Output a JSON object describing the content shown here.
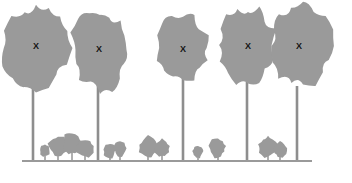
{
  "figure": {
    "clipped_top_text": "",
    "canvas": {
      "width": 352,
      "height": 183
    },
    "colors": {
      "background": "#ffffff",
      "foliage": "#9a9a9a",
      "trunk": "#8e8e8e",
      "ground": "#9a9a9a",
      "label": "#141414"
    },
    "ground": {
      "name": "ground-line",
      "y": 161,
      "x_start": 22,
      "x_end": 312,
      "thickness": 2.2
    },
    "canopy_trees": [
      {
        "id": "tree-1",
        "label": "X",
        "label_x": 36,
        "label_y": 47,
        "trunk_x": 33,
        "trunk_top": 72,
        "trunk_bottom": 161,
        "trunk_width": 2.6,
        "crown_cx": 36,
        "crown_cy": 48,
        "crown_rx": 33,
        "crown_ry": 43,
        "seed": 11
      },
      {
        "id": "tree-2",
        "label": "X",
        "label_x": 99,
        "label_y": 50,
        "trunk_x": 98,
        "trunk_top": 84,
        "trunk_bottom": 161,
        "trunk_width": 2.6,
        "crown_cx": 100,
        "crown_cy": 50,
        "crown_rx": 28,
        "crown_ry": 40,
        "seed": 23
      },
      {
        "id": "tree-3",
        "label": "X",
        "label_x": 183,
        "label_y": 50,
        "trunk_x": 183,
        "trunk_top": 70,
        "trunk_bottom": 161,
        "trunk_width": 2.6,
        "crown_cx": 183,
        "crown_cy": 48,
        "crown_rx": 26,
        "crown_ry": 31,
        "seed": 37
      },
      {
        "id": "tree-4",
        "label": "X",
        "label_x": 248,
        "label_y": 47,
        "trunk_x": 247,
        "trunk_top": 80,
        "trunk_bottom": 161,
        "trunk_width": 2.6,
        "crown_cx": 248,
        "crown_cy": 45,
        "crown_rx": 27,
        "crown_ry": 38,
        "seed": 53
      },
      {
        "id": "tree-5",
        "label": "X",
        "label_x": 299,
        "label_y": 47,
        "trunk_x": 297,
        "trunk_top": 86,
        "trunk_bottom": 161,
        "trunk_width": 2.6,
        "crown_cx": 303,
        "crown_cy": 46,
        "crown_rx": 31,
        "crown_ry": 41,
        "seed": 71
      }
    ],
    "understory_shrubs": [
      {
        "id": "shrub-1",
        "cx": 45,
        "cy": 152,
        "rx": 5,
        "ry": 6,
        "trunk_bottom": 161,
        "seed": 5
      },
      {
        "id": "shrub-2",
        "cx": 58,
        "cy": 147,
        "rx": 9,
        "ry": 10,
        "trunk_bottom": 161,
        "seed": 9
      },
      {
        "id": "shrub-3",
        "cx": 72,
        "cy": 146,
        "rx": 10,
        "ry": 11,
        "trunk_bottom": 161,
        "seed": 14
      },
      {
        "id": "shrub-4",
        "cx": 85,
        "cy": 149,
        "rx": 9,
        "ry": 9,
        "trunk_bottom": 161,
        "seed": 19
      },
      {
        "id": "shrub-5",
        "cx": 110,
        "cy": 152,
        "rx": 6,
        "ry": 7,
        "trunk_bottom": 161,
        "seed": 26
      },
      {
        "id": "shrub-6",
        "cx": 120,
        "cy": 151,
        "rx": 6,
        "ry": 8,
        "trunk_bottom": 161,
        "seed": 31
      },
      {
        "id": "shrub-7",
        "cx": 148,
        "cy": 148,
        "rx": 9,
        "ry": 10,
        "trunk_bottom": 161,
        "seed": 41
      },
      {
        "id": "shrub-8",
        "cx": 162,
        "cy": 149,
        "rx": 8,
        "ry": 9,
        "trunk_bottom": 161,
        "seed": 47
      },
      {
        "id": "shrub-9",
        "cx": 198,
        "cy": 153,
        "rx": 5,
        "ry": 6,
        "trunk_bottom": 161,
        "seed": 58
      },
      {
        "id": "shrub-10",
        "cx": 218,
        "cy": 149,
        "rx": 9,
        "ry": 10,
        "trunk_bottom": 161,
        "seed": 63
      },
      {
        "id": "shrub-11",
        "cx": 268,
        "cy": 148,
        "rx": 9,
        "ry": 11,
        "trunk_bottom": 161,
        "seed": 77
      },
      {
        "id": "shrub-12",
        "cx": 280,
        "cy": 151,
        "rx": 7,
        "ry": 8,
        "trunk_bottom": 161,
        "seed": 83
      }
    ]
  }
}
